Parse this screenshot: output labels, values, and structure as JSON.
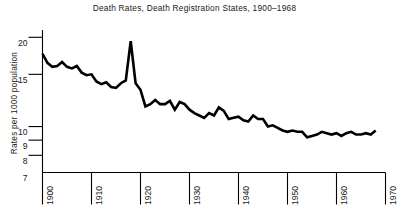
{
  "chart_data": {
    "type": "line",
    "title": "Death Rates, Death Registration States, 1900–1968",
    "xlabel": "",
    "ylabel": "Rates per 1000 population",
    "yscale": "log",
    "grid": false,
    "legend": "none",
    "xlim": [
      1900,
      1970
    ],
    "ylim": [
      7,
      21
    ],
    "xticks": [
      1900,
      1910,
      1920,
      1930,
      1940,
      1950,
      1960,
      1970
    ],
    "xticklabels": [
      "1900",
      "1910",
      "1920",
      "1930",
      "1940",
      "1950",
      "1960",
      "1970"
    ],
    "yticks": [
      7,
      8,
      9,
      10,
      15,
      20
    ],
    "yticklabels": [
      "7",
      "8",
      "9",
      "10",
      "15",
      "20"
    ],
    "series": [
      {
        "name": "Death rate per 1000 population",
        "x": [
          1900,
          1901,
          1902,
          1903,
          1904,
          1905,
          1906,
          1907,
          1908,
          1909,
          1910,
          1911,
          1912,
          1913,
          1914,
          1915,
          1916,
          1917,
          1918,
          1919,
          1920,
          1921,
          1922,
          1923,
          1924,
          1925,
          1926,
          1927,
          1928,
          1929,
          1930,
          1931,
          1932,
          1933,
          1934,
          1935,
          1936,
          1937,
          1938,
          1939,
          1940,
          1941,
          1942,
          1943,
          1944,
          1945,
          1946,
          1947,
          1948,
          1949,
          1950,
          1951,
          1952,
          1953,
          1954,
          1955,
          1956,
          1957,
          1958,
          1959,
          1960,
          1961,
          1962,
          1963,
          1964,
          1965,
          1966,
          1967,
          1968
        ],
        "values": [
          17.6,
          16.4,
          15.9,
          16.0,
          16.5,
          15.9,
          15.7,
          16.0,
          15.2,
          14.9,
          15.0,
          14.2,
          13.9,
          14.1,
          13.6,
          13.5,
          14.0,
          14.3,
          19.4,
          14.0,
          13.3,
          11.7,
          11.9,
          12.3,
          11.9,
          11.9,
          12.2,
          11.4,
          12.1,
          11.9,
          11.4,
          11.1,
          10.9,
          10.7,
          11.1,
          10.9,
          11.6,
          11.3,
          10.6,
          10.7,
          10.8,
          10.5,
          10.4,
          10.9,
          10.6,
          10.6,
          10.0,
          10.1,
          9.9,
          9.7,
          9.6,
          9.7,
          9.6,
          9.6,
          9.2,
          9.3,
          9.4,
          9.6,
          9.5,
          9.4,
          9.5,
          9.3,
          9.5,
          9.6,
          9.4,
          9.4,
          9.5,
          9.4,
          9.7
        ]
      }
    ]
  },
  "axes": {
    "x_axis_name": "year-axis",
    "y_axis_name": "rate-axis"
  }
}
